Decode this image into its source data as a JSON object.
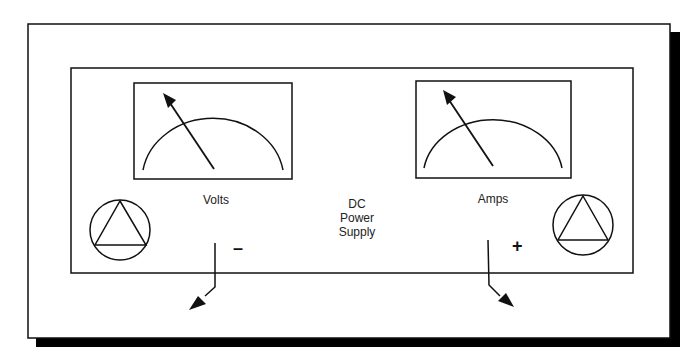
{
  "diagram": {
    "title": "DC Power Supply",
    "center_label_lines": [
      "DC",
      "Power",
      "Supply"
    ],
    "meters": [
      {
        "id": "volts",
        "label": "Volts"
      },
      {
        "id": "amps",
        "label": "Amps"
      }
    ],
    "terminals": [
      {
        "id": "negative",
        "sign": "–"
      },
      {
        "id": "positive",
        "sign": "+"
      }
    ],
    "knobs": [
      {
        "id": "left-knob",
        "shape": "triangle-in-circle"
      },
      {
        "id": "right-knob",
        "shape": "triangle-in-circle"
      }
    ],
    "colors": {
      "line": "#111111",
      "background": "#ffffff",
      "shadow": "#000000"
    }
  }
}
